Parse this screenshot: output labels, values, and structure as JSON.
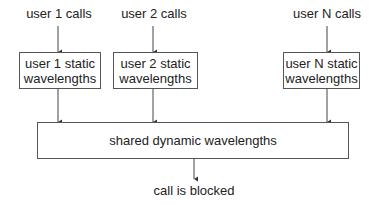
{
  "diagram": {
    "sources": [
      {
        "label": "user 1 calls",
        "box": "user 1 static wavelengths",
        "box_line1": "user 1 static",
        "box_line2": "wavelengths"
      },
      {
        "label": "user 2 calls",
        "box": "user 2 static wavelengths",
        "box_line1": "user 2 static",
        "box_line2": "wavelengths"
      },
      {
        "label": "user N calls",
        "box": "user N static wavelengths",
        "box_line1": "user N static",
        "box_line2": "wavelengths"
      }
    ],
    "shared_box": "shared dynamic wavelengths",
    "outcome": "call is blocked",
    "colors": {
      "line": "#444444",
      "border": "#555555",
      "text": "#222222"
    }
  }
}
